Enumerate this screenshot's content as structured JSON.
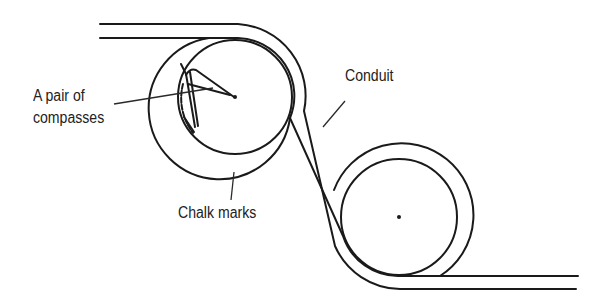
{
  "diagram": {
    "type": "technical illustration",
    "labels": {
      "compasses_line1": "A pair of",
      "compasses_line2": "compasses",
      "conduit": "Conduit",
      "chalk_marks": "Chalk marks"
    },
    "colors": {
      "line": "#1a1a1a",
      "background": "#ffffff"
    }
  }
}
